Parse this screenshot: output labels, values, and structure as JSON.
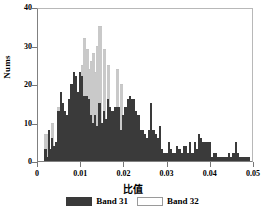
{
  "chart_data": {
    "type": "bar",
    "title": "",
    "subtitle": "",
    "xlabel": "比值",
    "ylabel": "Nums",
    "xlim": [
      0,
      0.05
    ],
    "ylim": [
      0,
      40
    ],
    "grid": false,
    "legend_position": "bottom",
    "xticks": [
      "0",
      "0.01",
      "0.02",
      "0.03",
      "0.04",
      "0.05"
    ],
    "xtick_values": [
      0,
      0.01,
      0.02,
      0.03,
      0.04,
      0.05
    ],
    "yticks": [
      "0",
      "10",
      "20",
      "30",
      "40"
    ],
    "ytick_values": [
      0,
      10,
      20,
      30,
      40
    ],
    "bin_width": 0.00025,
    "x": [
      0.0015,
      0.00175,
      0.002,
      0.00225,
      0.0025,
      0.00275,
      0.003,
      0.00325,
      0.0035,
      0.00375,
      0.004,
      0.00425,
      0.0045,
      0.00475,
      0.005,
      0.00525,
      0.0055,
      0.00575,
      0.006,
      0.00625,
      0.0065,
      0.00675,
      0.007,
      0.00725,
      0.0075,
      0.00775,
      0.008,
      0.00825,
      0.0085,
      0.00875,
      0.009,
      0.00925,
      0.0095,
      0.00975,
      0.01,
      0.01025,
      0.0105,
      0.01075,
      0.011,
      0.01125,
      0.0115,
      0.01175,
      0.012,
      0.01225,
      0.0125,
      0.01275,
      0.013,
      0.01325,
      0.0135,
      0.01375,
      0.014,
      0.01425,
      0.0145,
      0.01475,
      0.015,
      0.01525,
      0.0155,
      0.01575,
      0.016,
      0.01625,
      0.0165,
      0.01675,
      0.017,
      0.01725,
      0.0175,
      0.01775,
      0.018,
      0.01825,
      0.0185,
      0.01875,
      0.019,
      0.01925,
      0.0195,
      0.01975,
      0.02,
      0.02025,
      0.0205,
      0.02075,
      0.021,
      0.02125,
      0.0215,
      0.02175,
      0.022,
      0.02225,
      0.0225,
      0.02275,
      0.023,
      0.02325,
      0.0235,
      0.02375,
      0.024,
      0.02425,
      0.0245,
      0.02475,
      0.025,
      0.02525,
      0.0255,
      0.02575,
      0.026,
      0.02625,
      0.0265,
      0.02675,
      0.027,
      0.02725,
      0.0275,
      0.02775,
      0.028,
      0.02825,
      0.0285,
      0.02875,
      0.029,
      0.02925,
      0.0295,
      0.02975,
      0.03,
      0.03025,
      0.0305,
      0.03075,
      0.031,
      0.03125,
      0.0315,
      0.03175,
      0.032,
      0.03225,
      0.0325,
      0.03275,
      0.033,
      0.03325,
      0.0335,
      0.03375,
      0.034,
      0.03425,
      0.0345,
      0.03475,
      0.035,
      0.03525,
      0.0355,
      0.03575,
      0.036,
      0.03625,
      0.0365,
      0.03675,
      0.037,
      0.03725,
      0.0375,
      0.03775,
      0.038,
      0.03825,
      0.0385,
      0.03875,
      0.039,
      0.03925,
      0.0395,
      0.03975,
      0.04,
      0.04025,
      0.0405,
      0.04075,
      0.041,
      0.04125,
      0.0415,
      0.04175,
      0.042,
      0.04225,
      0.0425,
      0.04275,
      0.043,
      0.04325,
      0.0435,
      0.04375,
      0.044,
      0.04425,
      0.0445,
      0.04475,
      0.045,
      0.04525,
      0.0455,
      0.04575,
      0.046,
      0.04625,
      0.0465,
      0.04675,
      0.047,
      0.04725,
      0.0475,
      0.04775,
      0.048,
      0.04825,
      0.0485,
      0.04875
    ],
    "series": [
      {
        "name": "Band 31",
        "color": "#3a3a3a",
        "values": [
          3,
          3,
          1,
          8,
          8,
          3,
          6,
          6,
          4,
          4,
          5,
          5,
          13,
          13,
          18,
          18,
          15,
          15,
          13,
          13,
          12,
          12,
          16,
          16,
          20,
          20,
          23,
          23,
          22,
          22,
          18,
          18,
          23,
          23,
          22,
          22,
          17,
          17,
          17,
          17,
          16,
          16,
          12,
          12,
          10,
          10,
          12,
          12,
          9,
          9,
          15,
          15,
          10,
          10,
          13,
          13,
          11,
          11,
          16,
          16,
          14,
          14,
          13,
          13,
          14,
          14,
          14,
          14,
          14,
          14,
          8,
          8,
          12,
          12,
          14,
          14,
          16,
          16,
          17,
          17,
          16,
          16,
          16,
          16,
          13,
          13,
          12,
          12,
          8,
          8,
          8,
          8,
          7,
          7,
          6,
          6,
          8,
          8,
          15,
          15,
          8,
          8,
          7,
          7,
          6,
          6,
          9,
          9,
          3,
          3,
          2,
          2,
          2,
          2,
          5,
          5,
          3,
          3,
          2,
          2,
          2,
          2,
          4,
          4,
          3,
          3,
          2,
          2,
          4,
          4,
          4,
          4,
          2,
          2,
          5,
          5,
          2,
          2,
          5,
          5,
          3,
          3,
          7,
          7,
          6,
          6,
          5,
          5,
          5,
          5,
          5,
          5,
          5,
          5,
          1,
          1,
          2,
          2,
          2,
          2,
          1,
          1,
          1,
          1,
          1,
          1,
          1,
          1,
          1,
          1,
          2,
          2,
          1,
          1,
          2,
          2,
          5,
          5,
          2,
          2,
          1,
          1,
          1,
          1,
          1,
          1,
          1,
          1,
          1,
          1
        ]
      },
      {
        "name": "Band 32",
        "color": "#ffffff",
        "values": [
          7,
          7,
          0,
          0,
          0,
          0,
          10,
          10,
          0,
          0,
          0,
          0,
          14,
          14,
          0,
          0,
          0,
          0,
          0,
          0,
          0,
          0,
          0,
          0,
          0,
          0,
          0,
          0,
          0,
          0,
          0,
          0,
          0,
          0,
          25,
          25,
          32,
          32,
          29,
          29,
          24,
          24,
          26,
          26,
          28,
          28,
          23,
          23,
          30,
          30,
          35,
          35,
          0,
          0,
          29,
          29,
          0,
          0,
          25,
          25,
          0,
          0,
          0,
          0,
          0,
          0,
          24,
          24,
          0,
          0,
          20,
          20,
          0,
          0,
          0,
          0,
          0,
          0,
          0,
          0,
          0,
          0,
          0,
          0,
          0,
          0,
          0,
          0,
          0,
          0,
          0,
          0,
          0,
          0,
          0,
          0,
          0,
          0,
          0,
          0,
          0,
          0,
          0,
          0,
          0,
          0,
          0,
          0,
          0,
          0,
          0,
          0,
          0,
          0,
          0,
          0,
          0,
          0,
          0,
          0,
          0,
          0,
          0,
          0,
          0,
          0,
          0,
          0,
          0,
          0,
          0,
          0,
          0,
          0,
          0,
          0,
          0,
          0,
          0,
          0,
          0,
          0,
          0,
          0,
          0,
          0,
          0,
          0,
          0,
          0,
          0,
          0,
          0,
          0,
          0,
          0,
          0,
          0,
          0,
          0,
          0,
          0,
          0,
          0,
          0,
          0,
          0,
          0,
          0,
          0,
          0,
          0,
          0,
          0,
          0,
          0,
          0,
          0,
          0,
          0,
          0,
          0,
          0,
          0,
          0,
          0,
          0,
          0,
          0,
          0
        ]
      }
    ]
  },
  "legend": {
    "items": [
      {
        "label": "Band 31",
        "swatch": "band-31-swatch"
      },
      {
        "label": "Band 32",
        "swatch": "band-32-swatch"
      }
    ]
  }
}
